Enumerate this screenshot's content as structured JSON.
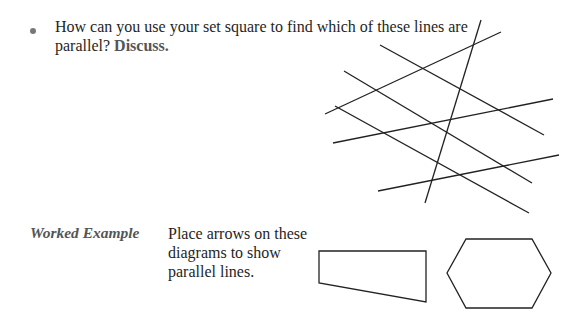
{
  "question": {
    "bullet": "•",
    "text": "How can you use your set square to find which of these lines are parallel?",
    "emphasis": "Discuss."
  },
  "figure_lines": {
    "description": "Seven intersecting straight lines",
    "stroke_color": "#222222",
    "lines": [
      {
        "x1": 481,
        "y1": 20,
        "x2": 425,
        "y2": 203
      },
      {
        "x1": 501,
        "y1": 32,
        "x2": 325,
        "y2": 114
      },
      {
        "x1": 380,
        "y1": 45,
        "x2": 544,
        "y2": 135
      },
      {
        "x1": 344,
        "y1": 71,
        "x2": 532,
        "y2": 183
      },
      {
        "x1": 335,
        "y1": 106,
        "x2": 529,
        "y2": 213
      },
      {
        "x1": 333,
        "y1": 143,
        "x2": 553,
        "y2": 99
      },
      {
        "x1": 378,
        "y1": 191,
        "x2": 559,
        "y2": 155
      }
    ]
  },
  "worked_example": {
    "label": "Worked Example",
    "instruction": "Place arrows on these diagrams to show parallel lines.",
    "trapezoid_points": "319,251 426,251 426,302 319,283",
    "hexagon_points": "466,239 532,239 551,273 532,308 466,308 447,273"
  }
}
